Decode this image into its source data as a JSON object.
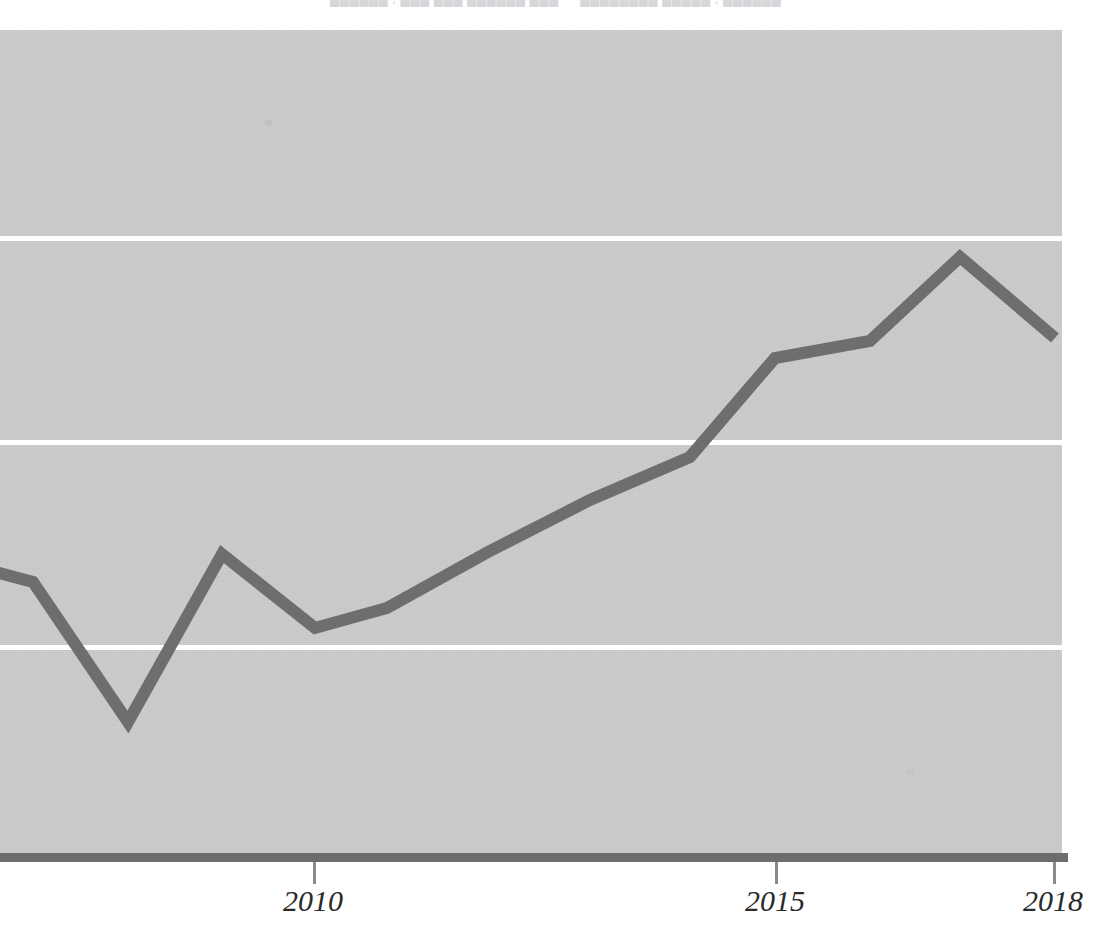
{
  "header": {
    "cut_off_text": "██████ , ███ ███ ██████ ███  —  ████████ █████ , ██████"
  },
  "colors": {
    "plot_background": "#c9c9c9",
    "gridline": "#ffffff",
    "series_line": "#6e6e6e",
    "axis_line": "#6d6d6d",
    "tick": "#8a8a8a",
    "label_text": "#2a2a2a",
    "page_background": "#ffffff"
  },
  "axis": {
    "tick_labels": [
      "2010",
      "2015",
      "2018"
    ],
    "tick_years": [
      2010,
      2015,
      2018
    ],
    "tick_x_px": [
      313,
      775,
      1053
    ],
    "gridline_y_px": [
      238,
      442,
      647
    ],
    "label_style": "italic-serif"
  },
  "chart_data": {
    "type": "line",
    "title": "",
    "subtitle": "",
    "xlabel": "",
    "ylabel": "",
    "legend": [],
    "legend_position": "none",
    "grid": true,
    "gridlines_horizontal": 3,
    "gridlines_vertical": 0,
    "x": [
      2007,
      2008,
      2009,
      2010,
      2011,
      2012,
      2013,
      2014,
      2015,
      2016,
      2017,
      2018
    ],
    "values": [
      4.05,
      2.4,
      4.39,
      3.52,
      3.76,
      4.48,
      5.21,
      5.92,
      7.1,
      7.31,
      8.34,
      7.35
    ],
    "series": [
      {
        "name": "series-1",
        "color": "#6e6e6e",
        "line_width_px": 12,
        "values": [
          4.05,
          2.4,
          4.39,
          3.52,
          3.76,
          4.48,
          5.21,
          5.92,
          7.1,
          7.31,
          8.34,
          7.35
        ]
      }
    ],
    "point_pixels": [
      [
        33,
        582
      ],
      [
        128,
        722
      ],
      [
        222,
        554
      ],
      [
        315,
        628
      ],
      [
        387,
        608
      ],
      [
        488,
        552
      ],
      [
        590,
        500
      ],
      [
        690,
        457
      ],
      [
        775,
        358
      ],
      [
        870,
        341
      ],
      [
        960,
        257
      ],
      [
        1055,
        338
      ]
    ],
    "xlim": [
      2006.97,
      2018.05
    ],
    "ylim": [
      0,
      10
    ],
    "axis_ranges_note": "y-axis unlabeled; gridlines evenly spaced",
    "annotations": [],
    "x_partially_cropped_left": true
  }
}
